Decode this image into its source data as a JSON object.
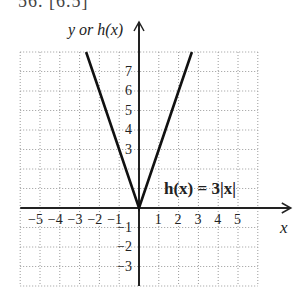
{
  "header": {
    "partial_text": "56. [6.5]"
  },
  "chart_data": {
    "type": "line",
    "title": "",
    "function_label": "h(x) = 3|x|",
    "xlabel": "x",
    "ylabel": "y or h(x)",
    "xlim": [
      -6,
      6
    ],
    "ylim": [
      -4,
      8
    ],
    "grid": true,
    "grid_style": "dotted",
    "x_ticks": [
      -5,
      -4,
      -3,
      -2,
      -1,
      1,
      2,
      3,
      4,
      5
    ],
    "y_ticks": [
      -3,
      -2,
      -1,
      3,
      4,
      5,
      6,
      7
    ],
    "x_tick_labels": [
      "−5",
      "−4",
      "−3",
      "−2",
      "−1",
      "1",
      "2",
      "3",
      "4",
      "5"
    ],
    "y_tick_labels": [
      "7",
      "6",
      "5",
      "4",
      "3",
      "−1",
      "−2",
      "−3"
    ],
    "series": [
      {
        "name": "h(x) = 3|x|",
        "x": [
          -2.67,
          -2,
          -1,
          0,
          1,
          2,
          2.67
        ],
        "y": [
          8,
          6,
          3,
          0,
          3,
          6,
          8
        ]
      }
    ],
    "line_color": "#111111",
    "grid_color": "#9a9a9a",
    "axis_color": "#222222"
  }
}
